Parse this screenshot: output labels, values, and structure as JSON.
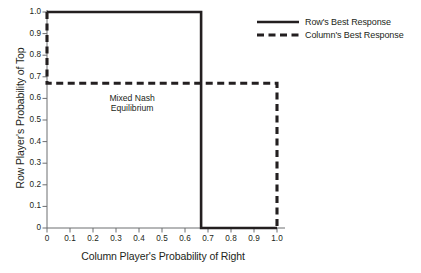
{
  "chart_data": {
    "type": "line",
    "title": "",
    "xlabel": "Column Player's Probability of Right",
    "ylabel": "Row Player's Probability of Top",
    "xlim": [
      0,
      1.0
    ],
    "ylim": [
      0,
      1.0
    ],
    "grid": false,
    "legend_position": "top-right",
    "xticks": [
      "0",
      "0.1",
      "0.2",
      "0.3",
      "0.4",
      "0.5",
      "0.6",
      "0.7",
      "0.8",
      "0.9",
      "1.0"
    ],
    "xtick_values": [
      0,
      0.1,
      0.2,
      0.3,
      0.4,
      0.5,
      0.6,
      0.7,
      0.8,
      0.9,
      1.0
    ],
    "yticks": [
      "0",
      "0.1",
      "0.2",
      "0.3",
      "0.4",
      "0.5",
      "0.6",
      "0.7",
      "0.8",
      "0.9",
      "1.0"
    ],
    "ytick_values": [
      0,
      0.1,
      0.2,
      0.3,
      0.4,
      0.5,
      0.6,
      0.7,
      0.8,
      0.9,
      1.0
    ],
    "series": [
      {
        "name": "Row's Best Response",
        "style": "solid",
        "color": "#231f20",
        "points": [
          [
            0,
            1.0
          ],
          [
            0.67,
            1.0
          ],
          [
            0.67,
            0
          ],
          [
            1.0,
            0
          ]
        ]
      },
      {
        "name": "Column's Best Response",
        "style": "dashed",
        "color": "#231f20",
        "points": [
          [
            0,
            1.0
          ],
          [
            0,
            0.67
          ],
          [
            1.0,
            0.67
          ],
          [
            1.0,
            0
          ]
        ]
      }
    ],
    "annotations": [
      {
        "text_line1": "Mixed Nash",
        "text_line2": "Equilibrium",
        "x": 0.37,
        "y": 0.58
      }
    ],
    "equilibrium_point": [
      0.67,
      0.67
    ]
  },
  "legend": {
    "items": [
      {
        "label": "Row's Best Response",
        "style": "solid"
      },
      {
        "label": "Column's Best Response",
        "style": "dashed"
      }
    ]
  },
  "axes": {
    "x_title": "Column Player's Probability of Right",
    "y_title": "Row Player's Probability of Top"
  },
  "colors": {
    "line": "#231f20",
    "axis": "#6d6e71",
    "background": "#ffffff"
  }
}
